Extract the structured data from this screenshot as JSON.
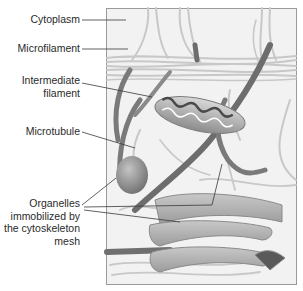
{
  "diagram": {
    "labels": [
      {
        "id": "cytoplasm",
        "text": "Cytoplasm"
      },
      {
        "id": "microfilament",
        "text": "Microfilament"
      },
      {
        "id": "intermediate-filament",
        "line1": "Intermediate",
        "line2": "filament"
      },
      {
        "id": "microtubule",
        "text": "Microtubule"
      },
      {
        "id": "organelles",
        "line1": "Organelles",
        "line2": "immobilized by",
        "line3": "the cytoskeleton",
        "line4": "mesh"
      }
    ],
    "colors": {
      "background": "#f2f2f2",
      "frame": "#9a9a9a",
      "filament": "#c9c9c9",
      "microtubule": "#7a7a7a",
      "organelle": "#a8a8a8",
      "leader_line": "#3a3a3a"
    }
  }
}
